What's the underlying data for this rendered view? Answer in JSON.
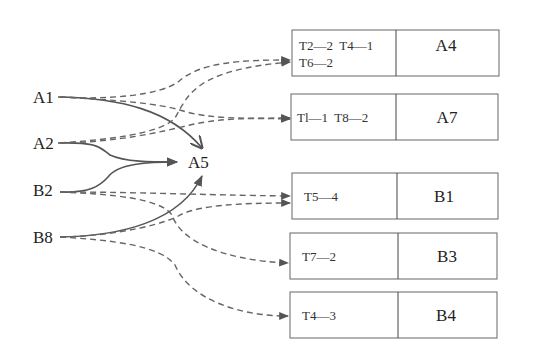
{
  "diagram": {
    "type": "flow",
    "colors": {
      "line": "#555555",
      "dashed": "#666666",
      "box_border": "#666666",
      "text": "#222222"
    },
    "sources": [
      {
        "id": "A1",
        "label": "A1"
      },
      {
        "id": "A2",
        "label": "A2"
      },
      {
        "id": "B2",
        "label": "B2"
      },
      {
        "id": "B8",
        "label": "B8"
      }
    ],
    "hub": {
      "id": "A5",
      "label": "A5"
    },
    "targets": [
      {
        "id": "A4",
        "name": "A4",
        "tags": [
          "T2—2  T4—1",
          "T6—2"
        ]
      },
      {
        "id": "A7",
        "name": "A7",
        "tags": [
          "Tl—1  T8—2"
        ]
      },
      {
        "id": "B1",
        "name": "B1",
        "tags": [
          "T5—4"
        ]
      },
      {
        "id": "B3",
        "name": "B3",
        "tags": [
          "T7—2"
        ]
      },
      {
        "id": "B4",
        "name": "B4",
        "tags": [
          "T4—3"
        ]
      }
    ],
    "edges": [
      {
        "from": "A1",
        "to": "A5",
        "style": "solid"
      },
      {
        "from": "A2",
        "to": "A5",
        "style": "solid"
      },
      {
        "from": "B2",
        "to": "A5",
        "style": "solid"
      },
      {
        "from": "B8",
        "to": "A5",
        "style": "solid"
      },
      {
        "from": "A1",
        "to": "A4",
        "style": "dashed"
      },
      {
        "from": "A1",
        "to": "A7",
        "style": "dashed"
      },
      {
        "from": "A2",
        "to": "A4",
        "style": "dashed"
      },
      {
        "from": "A2",
        "to": "A7",
        "style": "dashed"
      },
      {
        "from": "B2",
        "to": "B1",
        "style": "dashed"
      },
      {
        "from": "B2",
        "to": "B3",
        "style": "dashed"
      },
      {
        "from": "B8",
        "to": "B1",
        "style": "dashed"
      },
      {
        "from": "B8",
        "to": "B4",
        "style": "dashed"
      }
    ]
  }
}
